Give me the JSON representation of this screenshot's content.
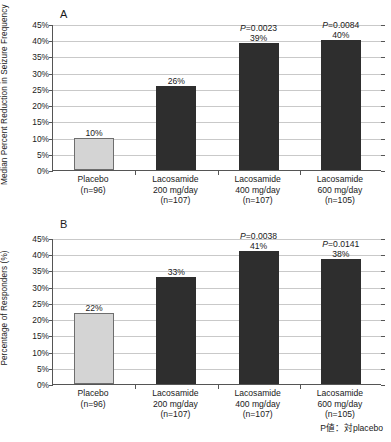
{
  "figure": {
    "footnote": "P値：対placebo"
  },
  "panels": [
    {
      "letter": "A",
      "ylabel": "Median Percent Reduction in Seizure Frequency"
    },
    {
      "letter": "B",
      "ylabel": "Percentage of Responders (%)"
    }
  ],
  "yticks": [
    "0%",
    "5%",
    "10%",
    "15%",
    "20%",
    "25%",
    "30%",
    "35%",
    "40%",
    "45%"
  ],
  "categories": [
    {
      "l1": "Placebo",
      "l2": "(n=96)",
      "l3": ""
    },
    {
      "l1": "Lacosamide",
      "l2": "200 mg/day",
      "l3": "(n=107)"
    },
    {
      "l1": "Lacosamide",
      "l2": "400 mg/day",
      "l3": "(n=107)"
    },
    {
      "l1": "Lacosamide",
      "l2": "600 mg/day",
      "l3": "(n=105)"
    }
  ],
  "colors": {
    "placebo_bar": "#d4d4d4",
    "treatment_bar": "#2e2e2e",
    "gridline": "#c9c9c9",
    "axis": "#555555"
  },
  "chart_data": [
    {
      "type": "bar",
      "title": "A",
      "xlabel": "",
      "ylabel": "Median Percent Reduction in Seizure Frequency",
      "ylim": [
        0,
        45
      ],
      "ytick_step": 5,
      "grid": true,
      "legend": "none",
      "categories": [
        "Placebo (n=96)",
        "Lacosamide 200 mg/day (n=107)",
        "Lacosamide 400 mg/day (n=107)",
        "Lacosamide 600 mg/day (n=105)"
      ],
      "values": [
        10,
        26,
        39,
        40
      ],
      "value_labels": [
        "10%",
        "26%",
        "39%",
        "40%"
      ],
      "annotations": [
        "",
        "",
        "P=0.0023",
        "P=0.0084"
      ]
    },
    {
      "type": "bar",
      "title": "B",
      "xlabel": "",
      "ylabel": "Percentage of Responders (%)",
      "ylim": [
        0,
        45
      ],
      "ytick_step": 5,
      "grid": true,
      "legend": "none",
      "categories": [
        "Placebo (n=96)",
        "Lacosamide 200 mg/day (n=107)",
        "Lacosamide 400 mg/day (n=107)",
        "Lacosamide 600 mg/day (n=105)"
      ],
      "values": [
        22,
        33,
        41,
        38.5
      ],
      "value_labels": [
        "22%",
        "33%",
        "41%",
        "38%"
      ],
      "annotations": [
        "",
        "",
        "P=0.0038",
        "P=0.0141"
      ]
    }
  ]
}
